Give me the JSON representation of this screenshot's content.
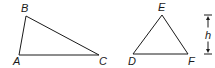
{
  "diagram": {
    "stroke_color": "#1a1a1a",
    "triangles": [
      {
        "name": "ABC",
        "vertices": [
          {
            "label": "A",
            "x": 19,
            "y": 55,
            "label_x": 13,
            "label_y": 65
          },
          {
            "label": "B",
            "x": 26,
            "y": 16,
            "label_x": 21,
            "label_y": 12
          },
          {
            "label": "C",
            "x": 99,
            "y": 55,
            "label_x": 99,
            "label_y": 65
          }
        ]
      },
      {
        "name": "DEF",
        "vertices": [
          {
            "label": "D",
            "x": 133,
            "y": 54,
            "label_x": 128,
            "label_y": 65
          },
          {
            "label": "E",
            "x": 162,
            "y": 15,
            "label_x": 158,
            "label_y": 11
          },
          {
            "label": "F",
            "x": 188,
            "y": 54,
            "label_x": 188,
            "label_y": 65
          }
        ]
      }
    ],
    "height_marker": {
      "label": "h",
      "x": 208,
      "top": 15,
      "bottom": 54
    }
  }
}
